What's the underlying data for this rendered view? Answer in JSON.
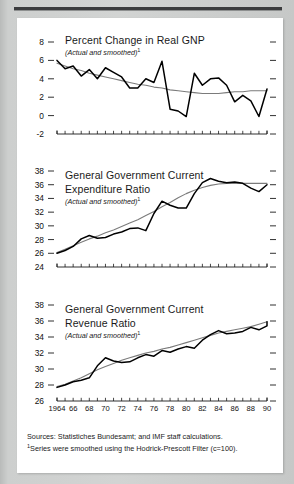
{
  "figure": {
    "footnote_sources": "Sources:  Statistiches Bundesamt; and IMF staff calculations.",
    "footnote_marker": "1",
    "footnote_note": "Series were smoothed using the Hodrick-Prescott Filter (c=100).",
    "subtitle_text": "(Actual and smoothed)",
    "subtitle_marker": "1",
    "line_color_actual": "#000000",
    "line_color_smoothed": "#7b7b7b"
  },
  "chart_data": [
    {
      "type": "line",
      "title": "Percent Change in Real GNP",
      "title_line2": "",
      "subtitle": "(Actual and smoothed)",
      "xlabel": "",
      "ylabel": "",
      "ylim": [
        -2,
        8
      ],
      "yticks": [
        8,
        6,
        4,
        2,
        0,
        -2
      ],
      "ytick_labels": [
        "8",
        "6",
        "4",
        "2",
        "0",
        "-2"
      ],
      "xlim": [
        1964,
        1990
      ],
      "xticks": [
        1964,
        1966,
        1968,
        1970,
        1972,
        1974,
        1976,
        1978,
        1980,
        1982,
        1984,
        1986,
        1988,
        1990
      ],
      "grid": false,
      "legend": "none",
      "x": [
        1964,
        1965,
        1966,
        1967,
        1968,
        1969,
        1970,
        1971,
        1972,
        1973,
        1974,
        1975,
        1976,
        1977,
        1978,
        1979,
        1980,
        1981,
        1982,
        1983,
        1984,
        1985,
        1986,
        1987,
        1988,
        1989,
        1990
      ],
      "series": [
        {
          "name": "Actual",
          "color": "#000000",
          "values": [
            6.0,
            5.1,
            5.4,
            4.3,
            5.0,
            4.0,
            5.2,
            4.7,
            4.2,
            3.0,
            3.0,
            4.0,
            3.6,
            5.9,
            0.7,
            0.5,
            -0.1,
            4.6,
            3.3,
            4.0,
            4.1,
            3.3,
            1.5,
            2.2,
            1.6,
            -0.1,
            2.9
          ]
        },
        {
          "name": "Smoothed",
          "color": "#7b7b7b",
          "values": [
            5.7,
            5.4,
            5.1,
            4.9,
            4.6,
            4.4,
            4.2,
            4.0,
            3.8,
            3.6,
            3.4,
            3.3,
            3.1,
            3.0,
            2.8,
            2.7,
            2.6,
            2.5,
            2.4,
            2.4,
            2.4,
            2.5,
            2.6,
            2.6,
            2.7,
            2.7,
            2.7
          ]
        }
      ]
    },
    {
      "type": "line",
      "title": "General Government Current",
      "title_line2": "Expenditure Ratio",
      "subtitle": "(Actual and smoothed)",
      "xlabel": "",
      "ylabel": "",
      "ylim": [
        24,
        38
      ],
      "yticks": [
        38,
        36,
        34,
        32,
        30,
        28,
        26,
        24
      ],
      "ytick_labels": [
        "38",
        "36",
        "34",
        "32",
        "30",
        "28",
        "26",
        "24"
      ],
      "xlim": [
        1964,
        1990
      ],
      "xticks": [
        1964,
        1966,
        1968,
        1970,
        1972,
        1974,
        1976,
        1978,
        1980,
        1982,
        1984,
        1986,
        1988,
        1990
      ],
      "grid": false,
      "legend": "none",
      "x": [
        1964,
        1965,
        1966,
        1967,
        1968,
        1969,
        1970,
        1971,
        1972,
        1973,
        1974,
        1975,
        1976,
        1977,
        1978,
        1979,
        1980,
        1981,
        1982,
        1983,
        1984,
        1985,
        1986,
        1987,
        1988,
        1989,
        1990
      ],
      "series": [
        {
          "name": "Actual",
          "color": "#000000",
          "values": [
            26.0,
            26.4,
            27.0,
            28.1,
            28.6,
            28.2,
            28.3,
            28.8,
            29.1,
            29.6,
            29.7,
            29.3,
            31.8,
            33.6,
            33.0,
            32.6,
            32.6,
            34.7,
            36.3,
            36.9,
            36.5,
            36.3,
            36.4,
            36.2,
            35.5,
            35.0,
            36.0
          ]
        },
        {
          "name": "Smoothed",
          "color": "#7b7b7b",
          "values": [
            26.1,
            26.6,
            27.1,
            27.6,
            28.1,
            28.5,
            29.0,
            29.4,
            29.9,
            30.4,
            30.9,
            31.5,
            32.1,
            32.8,
            33.4,
            34.1,
            34.7,
            35.2,
            35.6,
            35.9,
            36.1,
            36.2,
            36.2,
            36.2,
            36.2,
            36.2,
            36.2
          ]
        }
      ]
    },
    {
      "type": "line",
      "title": "General Government Current",
      "title_line2": "Revenue Ratio",
      "subtitle": "(Actual and smoothed)",
      "xlabel": "",
      "ylabel": "",
      "ylim": [
        26,
        38
      ],
      "yticks": [
        38,
        36,
        34,
        32,
        30,
        28,
        26
      ],
      "ytick_labels": [
        "38",
        "36",
        "34",
        "32",
        "30",
        "28",
        "26"
      ],
      "xlim": [
        1964,
        1990
      ],
      "xticks": [
        1964,
        1966,
        1968,
        1970,
        1972,
        1974,
        1976,
        1978,
        1980,
        1982,
        1984,
        1986,
        1988,
        1990
      ],
      "xtick_labels": [
        "1964",
        "66",
        "68",
        "70",
        "72",
        "74",
        "76",
        "78",
        "80",
        "82",
        "84",
        "86",
        "88",
        "90"
      ],
      "grid": false,
      "legend": "none",
      "x": [
        1964,
        1965,
        1966,
        1967,
        1968,
        1969,
        1970,
        1971,
        1972,
        1973,
        1974,
        1975,
        1976,
        1977,
        1978,
        1979,
        1980,
        1981,
        1982,
        1983,
        1984,
        1985,
        1986,
        1987,
        1988,
        1989,
        1990
      ],
      "series": [
        {
          "name": "Actual",
          "color": "#000000",
          "values": [
            27.7,
            28.0,
            28.4,
            28.6,
            28.9,
            30.4,
            31.4,
            31.0,
            30.8,
            30.9,
            31.4,
            31.8,
            31.6,
            32.3,
            32.1,
            32.5,
            32.8,
            32.6,
            33.6,
            34.3,
            34.8,
            34.4,
            34.5,
            34.7,
            35.2,
            34.9,
            35.4,
            35.9
          ]
        },
        {
          "name": "Smoothed",
          "color": "#7b7b7b",
          "values": [
            27.8,
            28.1,
            28.5,
            28.9,
            29.4,
            29.9,
            30.3,
            30.7,
            31.1,
            31.4,
            31.7,
            32.0,
            32.2,
            32.5,
            32.7,
            33.0,
            33.3,
            33.6,
            33.9,
            34.2,
            34.5,
            34.7,
            34.9,
            35.1,
            35.3,
            35.6,
            35.9
          ]
        }
      ]
    }
  ]
}
